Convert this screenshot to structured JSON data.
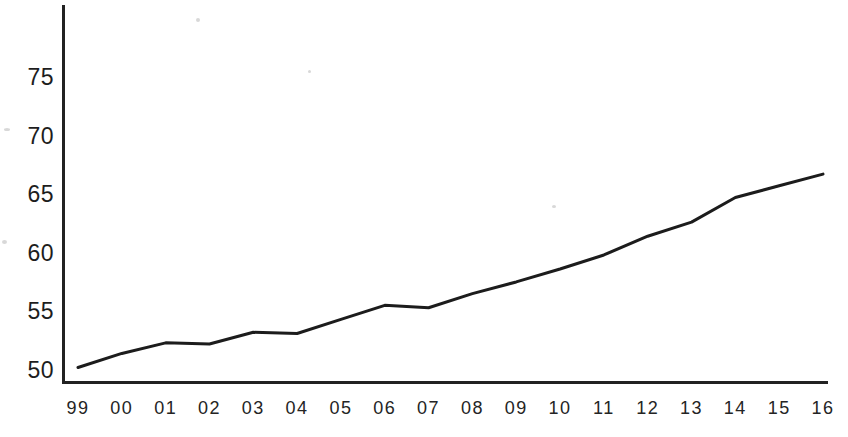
{
  "chart_data": {
    "type": "line",
    "title": "",
    "subtitle": "",
    "xlabel": "",
    "ylabel": "",
    "categories": [
      "99",
      "00",
      "01",
      "02",
      "03",
      "04",
      "05",
      "06",
      "07",
      "08",
      "09",
      "10",
      "11",
      "12",
      "13",
      "14",
      "15",
      "16"
    ],
    "values": [
      50.3,
      51.5,
      52.4,
      52.3,
      53.3,
      53.2,
      54.4,
      55.6,
      55.4,
      56.6,
      57.6,
      58.7,
      59.9,
      61.5,
      62.7,
      64.8,
      65.8,
      66.8
    ],
    "series": [
      {
        "name": "",
        "values": [
          50.3,
          51.5,
          52.4,
          52.3,
          53.3,
          53.2,
          54.4,
          55.6,
          55.4,
          56.6,
          57.6,
          58.7,
          59.9,
          61.5,
          62.7,
          64.8,
          65.8,
          66.8
        ]
      }
    ],
    "y_ticks": [
      50,
      55,
      60,
      65,
      70,
      75
    ],
    "y_tick_labels": [
      "50",
      "55",
      "60",
      "65",
      "70",
      "75"
    ],
    "x_tick_labels": [
      "99",
      "00",
      "01",
      "02",
      "03",
      "04",
      "05",
      "06",
      "07",
      "08",
      "09",
      "10",
      "11",
      "12",
      "13",
      "14",
      "15",
      "16"
    ],
    "ylim": [
      49.0,
      77.2
    ],
    "xlim": [
      0,
      17
    ],
    "grid": false,
    "legend": false,
    "legend_position": "none",
    "annotations": [],
    "line_color": "#1c1c1c",
    "background_color": "#ffffff",
    "axis_color": "#222222"
  },
  "axes": {
    "y_labels": [
      {
        "text": "75",
        "value": 75
      },
      {
        "text": "70",
        "value": 70
      },
      {
        "text": "65",
        "value": 65
      },
      {
        "text": "60",
        "value": 60
      },
      {
        "text": "55",
        "value": 55
      },
      {
        "text": "50",
        "value": 50
      }
    ],
    "x_labels": [
      {
        "text": "99"
      },
      {
        "text": "00"
      },
      {
        "text": "01"
      },
      {
        "text": "02"
      },
      {
        "text": "03"
      },
      {
        "text": "04"
      },
      {
        "text": "05"
      },
      {
        "text": "06"
      },
      {
        "text": "07"
      },
      {
        "text": "08"
      },
      {
        "text": "09"
      },
      {
        "text": "10"
      },
      {
        "text": "11"
      },
      {
        "text": "12"
      },
      {
        "text": "13"
      },
      {
        "text": "14"
      },
      {
        "text": "15"
      },
      {
        "text": "16"
      }
    ]
  }
}
